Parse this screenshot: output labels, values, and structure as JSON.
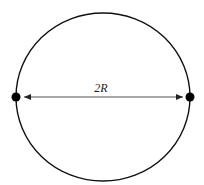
{
  "diagram": {
    "type": "circle-diameter",
    "label": "2R",
    "label_number": "2",
    "label_symbol": "R",
    "colors": {
      "outline": "#111111",
      "arrow": "#444444",
      "point": "#000000",
      "background": "#ffffff"
    },
    "elements": [
      {
        "kind": "circle",
        "description": "circle outline"
      },
      {
        "kind": "point",
        "description": "left endpoint of diameter"
      },
      {
        "kind": "point",
        "description": "right endpoint of diameter"
      },
      {
        "kind": "double-arrow",
        "description": "diameter arrow spanning circle",
        "label": "2R"
      }
    ]
  }
}
